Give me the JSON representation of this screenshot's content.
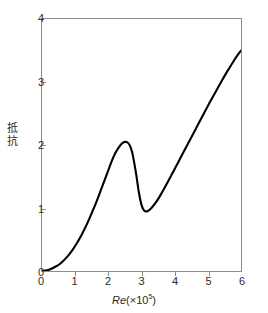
{
  "chart_data": {
    "type": "line",
    "title": "",
    "xlabel": "Re (×10⁵)",
    "xlabel_symbol": "Re",
    "xlabel_factor": "(×10",
    "xlabel_exponent": "5",
    "xlabel_close": ")",
    "ylabel": "抵抗",
    "ylabel_chars": [
      "抵",
      "抗"
    ],
    "xlim": [
      0,
      6
    ],
    "ylim": [
      0,
      4
    ],
    "xticks": [
      0,
      1,
      2,
      3,
      4,
      5,
      6
    ],
    "xtick_labels": [
      "0",
      "1",
      "2",
      "3",
      "4",
      "5",
      "6"
    ],
    "yticks": [
      0,
      1,
      2,
      3,
      4
    ],
    "ytick_labels": [
      "0",
      "1",
      "2",
      "3",
      "4"
    ],
    "grid": false,
    "legend": false,
    "series": [
      {
        "name": "drag",
        "color": "#000000",
        "linewidth": 2,
        "x": [
          0.0,
          0.15,
          0.3,
          0.45,
          0.6,
          0.75,
          0.9,
          1.05,
          1.2,
          1.35,
          1.5,
          1.65,
          1.8,
          1.95,
          2.1,
          2.2,
          2.3,
          2.4,
          2.5,
          2.58,
          2.65,
          2.72,
          2.78,
          2.85,
          2.92,
          3.0,
          3.08,
          3.18,
          3.3,
          3.45,
          3.6,
          3.8,
          4.0,
          4.2,
          4.4,
          4.6,
          4.8,
          5.0,
          5.2,
          5.4,
          5.6,
          5.8,
          6.0
        ],
        "y": [
          0.0,
          0.01,
          0.04,
          0.08,
          0.14,
          0.22,
          0.32,
          0.44,
          0.58,
          0.74,
          0.92,
          1.11,
          1.32,
          1.53,
          1.74,
          1.86,
          1.95,
          2.02,
          2.05,
          2.04,
          1.99,
          1.88,
          1.72,
          1.5,
          1.25,
          1.05,
          0.96,
          0.95,
          1.0,
          1.1,
          1.23,
          1.42,
          1.62,
          1.82,
          2.02,
          2.22,
          2.42,
          2.62,
          2.81,
          3.0,
          3.18,
          3.35,
          3.5
        ]
      }
    ],
    "frame_color": "#8d8d8d",
    "background": "#ffffff"
  }
}
